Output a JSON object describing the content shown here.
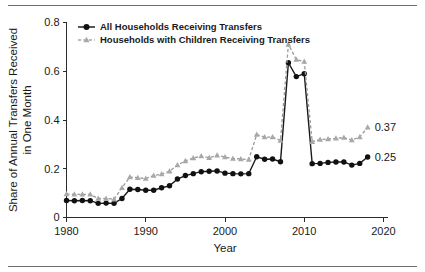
{
  "figure": {
    "has_top_rule": true,
    "has_bottom_rule": true,
    "background": "#ffffff"
  },
  "legend": {
    "position": "top-left",
    "entries": [
      {
        "label": "All Households Receiving Transfers",
        "marker": "filled-circle",
        "color": "#111111",
        "line": "solid"
      },
      {
        "label": "Households with Children Receiving Transfers",
        "marker": "filled-triangle",
        "color": "#a8a8a8",
        "line": "dashed"
      }
    ]
  },
  "annotations": {
    "end_label_children": "0.37",
    "end_label_all": "0.25"
  },
  "chart_data": {
    "type": "line",
    "title": "",
    "xlabel": "Year",
    "ylabel": "Share of Annual Transfers Received in One Month",
    "ylabel_line1": "Share of Annual Transfers Received",
    "ylabel_line2": "in One Month",
    "xlim": [
      1980,
      2020
    ],
    "ylim": [
      0,
      0.8
    ],
    "xticks": [
      1980,
      1990,
      2000,
      2010,
      2020
    ],
    "xtick_labels": [
      "1980",
      "1990",
      "2000",
      "2010",
      "2020"
    ],
    "yticks": [
      0,
      0.2,
      0.4,
      0.6,
      0.8
    ],
    "ytick_labels": [
      "0",
      "0.2",
      "0.4",
      "0.6",
      "0.8"
    ],
    "grid": false,
    "legend_position": "upper left",
    "x": [
      1980,
      1981,
      1982,
      1983,
      1984,
      1985,
      1986,
      1987,
      1988,
      1989,
      1990,
      1991,
      1992,
      1993,
      1994,
      1995,
      1996,
      1997,
      1998,
      1999,
      2000,
      2001,
      2002,
      2003,
      2004,
      2005,
      2006,
      2007,
      2008,
      2009,
      2010,
      2011,
      2012,
      2013,
      2014,
      2015,
      2016,
      2017,
      2018
    ],
    "series": [
      {
        "name": "All Households Receiving Transfers",
        "color": "#111111",
        "marker": "filled-circle",
        "linestyle": "solid",
        "values": [
          0.07,
          0.069,
          0.07,
          0.069,
          0.058,
          0.059,
          0.058,
          0.078,
          0.116,
          0.115,
          0.112,
          0.112,
          0.122,
          0.13,
          0.158,
          0.172,
          0.18,
          0.188,
          0.19,
          0.191,
          0.182,
          0.18,
          0.179,
          0.18,
          0.249,
          0.239,
          0.24,
          0.229,
          0.635,
          0.578,
          0.59,
          0.221,
          0.222,
          0.226,
          0.228,
          0.228,
          0.215,
          0.222,
          0.248
        ]
      },
      {
        "name": "Households with Children Receiving Transfers",
        "color": "#a8a8a8",
        "marker": "filled-triangle",
        "linestyle": "dashed",
        "values": [
          0.096,
          0.095,
          0.095,
          0.095,
          0.078,
          0.078,
          0.075,
          0.122,
          0.166,
          0.163,
          0.16,
          0.172,
          0.178,
          0.19,
          0.215,
          0.232,
          0.244,
          0.252,
          0.245,
          0.255,
          0.248,
          0.242,
          0.24,
          0.238,
          0.34,
          0.33,
          0.33,
          0.316,
          0.71,
          0.648,
          0.64,
          0.311,
          0.32,
          0.322,
          0.325,
          0.328,
          0.318,
          0.33,
          0.37
        ]
      }
    ]
  }
}
